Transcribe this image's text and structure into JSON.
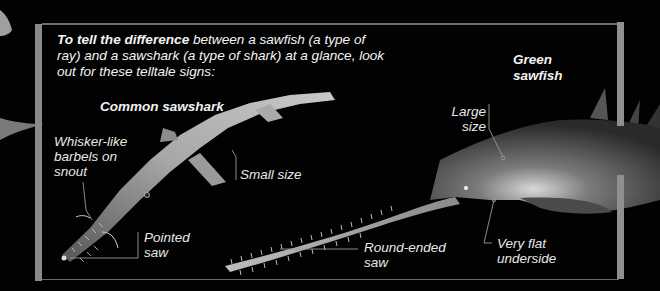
{
  "intro": {
    "bold_lead": "To tell the difference",
    "rest": " between a sawfish (a type of ray) and a sawshark (a type of shark) at a glance, look out for these telltale signs:"
  },
  "sawshark": {
    "title": "Common sawshark",
    "labels": {
      "barbels_line1": "Whisker-like",
      "barbels_line2": "barbels on",
      "barbels_line3": "snout",
      "size": "Small size",
      "saw_line1": "Pointed",
      "saw_line2": "saw"
    }
  },
  "sawfish": {
    "title_line1": "Green",
    "title_line2": "sawfish",
    "labels": {
      "size_line1": "Large",
      "size_line2": "size",
      "saw_line1": "Round-ended",
      "saw_line2": "saw",
      "underside_line1": "Very flat",
      "underside_line2": "underside"
    }
  },
  "colors": {
    "background": "#020202",
    "frame": "#8a8a8a",
    "text": "#f2f2f2",
    "leader_line": "#9a9a9a"
  }
}
